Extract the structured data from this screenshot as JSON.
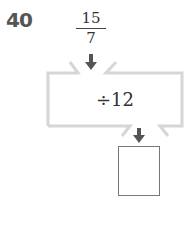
{
  "problem": {
    "number": "40",
    "input": {
      "numerator": "15",
      "denominator": "7"
    },
    "operation": "÷12",
    "answer": ""
  },
  "colors": {
    "frame": "#d9d9d9",
    "arrow": "#555555",
    "number": "#555555"
  }
}
